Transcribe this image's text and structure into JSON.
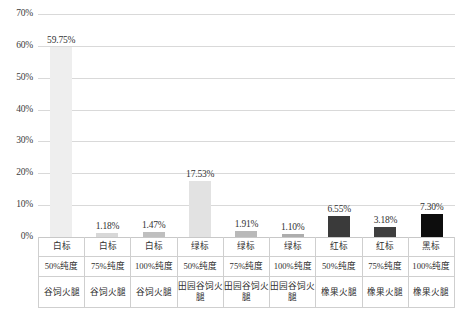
{
  "chart_data": {
    "type": "bar",
    "title": "",
    "xlabel": "",
    "ylabel": "",
    "ylim": [
      0,
      70
    ],
    "ytick_labels": [
      "70%",
      "60%",
      "50%",
      "40%",
      "30%",
      "20%",
      "10%",
      "0%"
    ],
    "ytick_values": [
      70,
      60,
      50,
      40,
      30,
      20,
      10,
      0
    ],
    "grid": true,
    "legend": "none",
    "categories": [
      "白标 50%纯度 谷饲火腿",
      "白标 75%纯度 谷饲火腿",
      "白标 100%纯度 谷饲火腿",
      "绿标 50%纯度 田园谷饲火腿",
      "绿标 75%纯度 田园谷饲火腿",
      "绿标 100%纯度 田园谷饲火腿",
      "红标 50%纯度 橡果火腿",
      "红标 75%纯度 橡果火腿",
      "黑标 100%纯度 橡果火腿"
    ],
    "values": [
      59.75,
      1.18,
      1.47,
      17.53,
      1.91,
      1.1,
      6.55,
      3.18,
      7.3
    ],
    "value_labels": [
      "59.75%",
      "1.18%",
      "1.47%",
      "17.53%",
      "1.91%",
      "1.10%",
      "6.55%",
      "3.18%",
      "7.30%"
    ],
    "bar_colors": [
      "#eeeeee",
      "#d8d8d8",
      "#bfbfbf",
      "#e2e2e2",
      "#b9b9b9",
      "#adadad",
      "#3a3a3a",
      "#3f3f3f",
      "#0d0d0d"
    ],
    "axis_table": {
      "row_labels": [
        "grade",
        "purity",
        "product"
      ],
      "rows": [
        [
          "白标",
          "白标",
          "白标",
          "绿标",
          "绿标",
          "绿标",
          "红标",
          "红标",
          "黑标"
        ],
        [
          "50%纯度",
          "75%纯度",
          "100%纯度",
          "50%纯度",
          "75%纯度",
          "100%纯度",
          "50%纯度",
          "75%纯度",
          "100%纯度"
        ],
        [
          "谷饲火腿",
          "谷饲火腿",
          "谷饲火腿",
          "田园谷饲火腿",
          "田园谷饲火腿",
          "田园谷饲火腿",
          "橡果火腿",
          "橡果火腿",
          "橡果火腿"
        ]
      ]
    }
  },
  "colors": {
    "gridline": "#d9d9d9",
    "baseline": "#c8c8c8",
    "table_border": "#cfcfcf",
    "text": "#3a3a3a"
  },
  "caption": ""
}
